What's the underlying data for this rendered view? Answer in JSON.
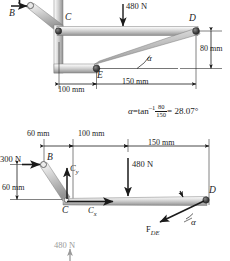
{
  "figure": {
    "angle_equation": {
      "symbol": "α",
      "equals": "=",
      "func": "tan",
      "exponent": "–1",
      "numerator": "80",
      "denominator": "150",
      "result": "= 28.07°",
      "full_text": "α = tan⁻¹ 80/150 = 28.07°"
    }
  },
  "top_diagram": {
    "name": "frame-assembly",
    "points": [
      {
        "id": "B",
        "label": "B"
      },
      {
        "id": "C",
        "label": "C"
      },
      {
        "id": "D",
        "label": "D"
      },
      {
        "id": "E",
        "label": "E"
      }
    ],
    "loads": [
      {
        "id": "load-480",
        "label": "480 N",
        "direction": "down"
      }
    ],
    "dimensions": [
      {
        "id": "dim-100",
        "label": "100 mm",
        "orientation": "horizontal"
      },
      {
        "id": "dim-150",
        "label": "150 mm",
        "orientation": "horizontal"
      },
      {
        "id": "dim-80",
        "label": "80 mm",
        "orientation": "vertical"
      }
    ],
    "angles": [
      {
        "id": "angle-alpha",
        "label": "α"
      }
    ]
  },
  "bottom_diagram": {
    "name": "free-body-diagram",
    "points": [
      {
        "id": "B",
        "label": "B"
      },
      {
        "id": "C",
        "label": "C"
      },
      {
        "id": "D",
        "label": "D"
      }
    ],
    "forces": [
      {
        "id": "force-300",
        "label": "300 N",
        "direction": "right"
      },
      {
        "id": "force-Cy",
        "label": "C",
        "subscript": "y",
        "direction": "up"
      },
      {
        "id": "force-Cx",
        "label": "C",
        "subscript": "x",
        "direction": "right"
      },
      {
        "id": "force-480",
        "label": "480 N",
        "direction": "down"
      },
      {
        "id": "force-FDE",
        "label": "F",
        "subscript": "DE",
        "direction": "down-left"
      },
      {
        "id": "force-480-bottom",
        "label": "480 N",
        "direction": "up"
      }
    ],
    "dimensions": [
      {
        "id": "dim-60h",
        "label": "60 mm",
        "orientation": "horizontal"
      },
      {
        "id": "dim-100h",
        "label": "100 mm",
        "orientation": "horizontal"
      },
      {
        "id": "dim-150h",
        "label": "150 mm",
        "orientation": "horizontal"
      },
      {
        "id": "dim-60v",
        "label": "60 mm",
        "orientation": "vertical"
      }
    ],
    "angles": [
      {
        "id": "angle-alpha-fbd",
        "label": "α"
      }
    ]
  },
  "colors": {
    "ink": "#1a1a1a",
    "member_light": "#f2f2f2",
    "member_mid": "#c9c9c9",
    "member_dark": "#8e8e8e",
    "pin": "#4a4a4a",
    "faint": "#9a9a9a"
  }
}
